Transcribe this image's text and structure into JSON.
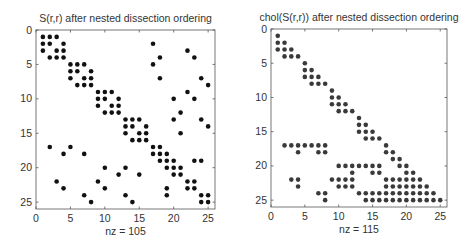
{
  "figure": {
    "width": 467,
    "height": 243,
    "background": "#ffffff"
  },
  "chart_data": [
    {
      "type": "scatter",
      "subtype": "spy",
      "title": "S(r,r) after nested dissection ordering",
      "xlabel": "nz = 105",
      "ylabel": "",
      "nz": 105,
      "xlim": [
        0,
        26
      ],
      "ylim": [
        26,
        0
      ],
      "xticks": [
        0,
        5,
        10,
        15,
        20,
        25
      ],
      "yticks": [
        0,
        5,
        10,
        15,
        20,
        25
      ],
      "grid": false,
      "marker_color": "#111111",
      "box": {
        "x0": 36,
        "y0": 30,
        "x1": 215,
        "y1": 209
      },
      "rows": {
        "1": [
          1,
          2,
          3
        ],
        "2": [
          1,
          2,
          4,
          17
        ],
        "3": [
          1,
          3,
          4,
          22
        ],
        "4": [
          2,
          3,
          4,
          18,
          23
        ],
        "5": [
          5,
          6,
          7,
          17
        ],
        "6": [
          5,
          6,
          8
        ],
        "7": [
          5,
          7,
          8,
          18,
          24
        ],
        "8": [
          6,
          7,
          8,
          25
        ],
        "9": [
          9,
          10,
          11,
          22
        ],
        "10": [
          9,
          10,
          12,
          20,
          23
        ],
        "11": [
          9,
          11,
          12
        ],
        "12": [
          10,
          11,
          12,
          21
        ],
        "13": [
          13,
          14,
          15,
          20,
          24
        ],
        "14": [
          13,
          14,
          16,
          25
        ],
        "15": [
          13,
          15,
          16,
          21
        ],
        "16": [
          14,
          15,
          16
        ],
        "17": [
          2,
          5,
          17,
          18
        ],
        "18": [
          4,
          7,
          17,
          18,
          19
        ],
        "19": [
          18,
          19,
          20,
          23,
          24
        ],
        "20": [
          10,
          13,
          19,
          20,
          21
        ],
        "21": [
          12,
          15,
          20,
          21
        ],
        "22": [
          3,
          9,
          22,
          23
        ],
        "23": [
          4,
          10,
          19,
          22,
          23
        ],
        "24": [
          7,
          13,
          19,
          24,
          25
        ],
        "25": [
          8,
          14,
          24,
          25
        ]
      }
    },
    {
      "type": "scatter",
      "subtype": "spy",
      "title": "chol(S(r,r)) after nested dissection ordering",
      "xlabel": "nz = 115",
      "ylabel": "",
      "nz": 115,
      "xlim": [
        0,
        26
      ],
      "ylim": [
        26,
        0
      ],
      "xticks": [
        0,
        5,
        10,
        15,
        20,
        25
      ],
      "yticks": [
        0,
        5,
        10,
        15,
        20,
        25
      ],
      "grid": false,
      "marker_color": "#3a3a3a",
      "box": {
        "x0": 271,
        "y0": 29,
        "x1": 447,
        "y1": 207
      },
      "rows": {
        "1": [
          1
        ],
        "2": [
          1,
          2
        ],
        "3": [
          1,
          2,
          3
        ],
        "4": [
          2,
          3,
          4
        ],
        "5": [
          5
        ],
        "6": [
          5,
          6
        ],
        "7": [
          5,
          6,
          7
        ],
        "8": [
          6,
          7,
          8
        ],
        "9": [
          9
        ],
        "10": [
          9,
          10
        ],
        "11": [
          9,
          10,
          11
        ],
        "12": [
          10,
          11,
          12
        ],
        "13": [
          13
        ],
        "14": [
          13,
          14
        ],
        "15": [
          13,
          14,
          15
        ],
        "16": [
          14,
          15,
          16
        ],
        "17": [
          2,
          3,
          4,
          5,
          6,
          7,
          8,
          17
        ],
        "18": [
          4,
          7,
          8,
          17,
          18
        ],
        "19": [
          18,
          19
        ],
        "20": [
          10,
          11,
          12,
          13,
          14,
          15,
          16,
          19,
          20
        ],
        "21": [
          12,
          15,
          16,
          20,
          21
        ],
        "22": [
          3,
          4,
          9,
          10,
          11,
          12,
          17,
          18,
          19,
          20,
          21,
          22
        ],
        "23": [
          4,
          10,
          11,
          12,
          17,
          18,
          19,
          20,
          21,
          22,
          23
        ],
        "24": [
          7,
          8,
          13,
          14,
          15,
          16,
          17,
          18,
          19,
          20,
          21,
          22,
          23,
          24
        ],
        "25": [
          8,
          14,
          15,
          16,
          17,
          18,
          19,
          20,
          21,
          22,
          23,
          24,
          25
        ]
      }
    }
  ]
}
